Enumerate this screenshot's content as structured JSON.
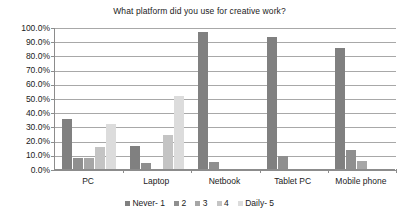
{
  "chart_data": {
    "type": "bar",
    "title": "What platform did you use for creative work?",
    "xlabel": "",
    "ylabel": "",
    "ylim": [
      0,
      100
    ],
    "ytick_labels": [
      "100.0%",
      "90.0%",
      "80.0%",
      "70.0%",
      "60.0%",
      "50.0%",
      "40.0%",
      "30.0%",
      "20.0%",
      "10.0%",
      "0.0%"
    ],
    "ytick_values": [
      100,
      90,
      80,
      70,
      60,
      50,
      40,
      30,
      20,
      10,
      0
    ],
    "grid": true,
    "legend_position": "bottom",
    "categories": [
      "PC",
      "Laptop",
      "Netbook",
      "Tablet PC",
      "Mobile phone"
    ],
    "series": [
      {
        "name": "Never- 1",
        "color": "#808080",
        "values": [
          35.5,
          16.0,
          96.5,
          93.0,
          85.5
        ]
      },
      {
        "name": "2",
        "color": "#8f8f8f",
        "values": [
          7.5,
          4.5,
          5.0,
          9.0,
          13.5
        ]
      },
      {
        "name": "3",
        "color": "#a6a6a6",
        "values": [
          7.5,
          0.0,
          0.0,
          0.0,
          5.5
        ]
      },
      {
        "name": "4",
        "color": "#c4c4c4",
        "values": [
          15.5,
          23.8,
          0.0,
          0.0,
          0.0
        ]
      },
      {
        "name": "Daily- 5",
        "color": "#dcdcdc",
        "values": [
          32.0,
          51.5,
          0.0,
          0.0,
          0.0
        ]
      }
    ]
  },
  "axis": {
    "axis_color": "#8c8c8c",
    "grid_color": "#a8a8a8"
  }
}
